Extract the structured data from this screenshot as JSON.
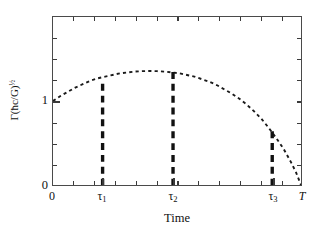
{
  "chart_data": {
    "type": "line",
    "title": "",
    "xlabel": "Time",
    "ylabel_parts": {
      "symbol": "Γ",
      "open": "(",
      "hbar": "ħ",
      "c": "c",
      "over": "/",
      "G": "G",
      "close": ")",
      "exponent": "½",
      "full": "Γ(ħc/G)½"
    },
    "xlim": [
      0,
      1
    ],
    "ylim": [
      0,
      2
    ],
    "grid": false,
    "legend": null,
    "xtick_labels": [
      "0",
      "τ1",
      "τ2",
      "τ3",
      "T"
    ],
    "xtick_values": [
      0.0,
      0.2,
      0.484,
      0.884,
      1.0
    ],
    "ytick_labels": [
      "1",
      "0"
    ],
    "ytick_values": [
      1.0,
      0.0
    ],
    "series": [
      {
        "name": "decay-rate-curve",
        "style": "dotted",
        "color": "#1a1a1a",
        "x": [
          0.0,
          0.03,
          0.06,
          0.09,
          0.12,
          0.15,
          0.18,
          0.21,
          0.24,
          0.27,
          0.3,
          0.33,
          0.36,
          0.39,
          0.42,
          0.45,
          0.48,
          0.51,
          0.54,
          0.57,
          0.6,
          0.63,
          0.66,
          0.69,
          0.72,
          0.75,
          0.78,
          0.81,
          0.84,
          0.87,
          0.9,
          0.93,
          0.96,
          0.98,
          1.0
        ],
        "y": [
          1.0,
          1.06,
          1.11,
          1.16,
          1.2,
          1.24,
          1.27,
          1.29,
          1.31,
          1.33,
          1.34,
          1.35,
          1.355,
          1.357,
          1.355,
          1.35,
          1.34,
          1.33,
          1.31,
          1.29,
          1.26,
          1.23,
          1.19,
          1.14,
          1.09,
          1.03,
          0.96,
          0.88,
          0.79,
          0.68,
          0.56,
          0.43,
          0.27,
          0.15,
          0.0
        ]
      }
    ],
    "vertical_markers": [
      {
        "name": "tau1-marker",
        "x": 0.2,
        "y_top": 1.205,
        "label": "τ1"
      },
      {
        "name": "tau2-marker",
        "x": 0.484,
        "y_top": 1.345,
        "label": "τ2"
      },
      {
        "name": "tau3-marker",
        "x": 0.884,
        "y_top": 0.64,
        "label": "τ3"
      }
    ],
    "axis_color": "#4a4a4a",
    "curve_color": "#1a1a1a",
    "marker_color": "#111111"
  }
}
